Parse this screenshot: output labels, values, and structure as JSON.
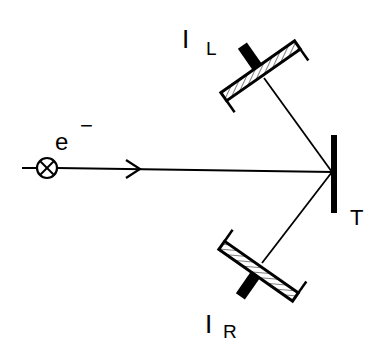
{
  "diagram": {
    "type": "experimental-setup",
    "elements": {
      "electron_source": {
        "label": "e",
        "superscript": "−",
        "icon": "crossed-circle-icon"
      },
      "beam_arrow": {
        "icon": "arrow-right-icon"
      },
      "target": {
        "label": "T"
      },
      "detector_left": {
        "label": "I",
        "subscript": "L"
      },
      "detector_right": {
        "label": "I",
        "subscript": "R"
      }
    },
    "colors": {
      "ink": "#000000",
      "background": "#ffffff"
    }
  }
}
